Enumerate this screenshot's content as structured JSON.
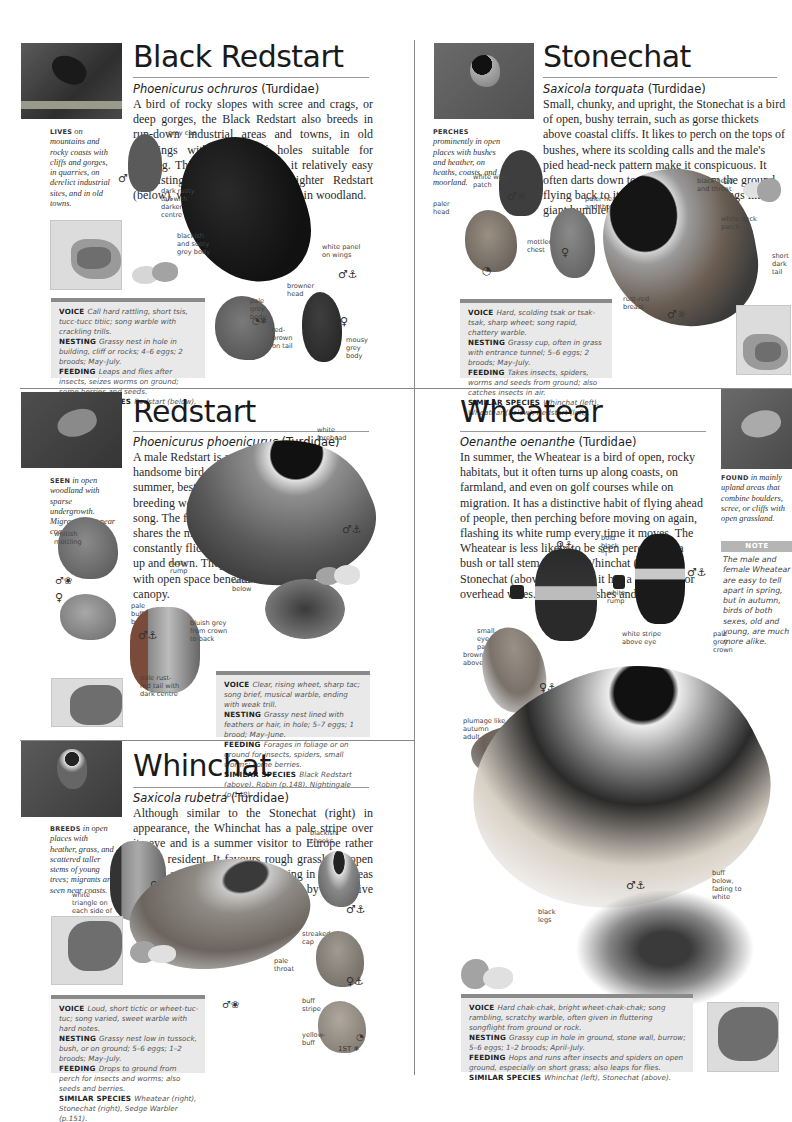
{
  "page": {
    "type": "Bird field guide spread (Chats and Wheatear)"
  },
  "colors": {
    "info_box_bg": "#e9e9e9",
    "info_box_bar": "#8a8a8a",
    "divider": "#888888",
    "note_header": "#b5b5b5"
  },
  "entries": {
    "black_redstart": {
      "title": "Black Redstart",
      "latin": "Phoenicurus ochruros",
      "family": "(Turdidae)",
      "description": "A bird of rocky slopes with scree and crags, or deep gorges, the Black Redstart also breeds in run-down industrial areas and towns, in old buildings with plenty of holes suitable for nesting. This preference makes it relatively easy to distinguish it from the brighter Redstart (below), which nearly always lives in woodland.",
      "habitat_key": "LIVES",
      "habitat_text": "on mountains and rocky coasts with cliffs and gorges, in quarries, on derelict industrial sites, and in old towns.",
      "labels": [
        "grey cap",
        "dark rusty tail with darker centre",
        "blackish and sooty grey body",
        "white panel on wings",
        "browner head",
        "pale grey body",
        "red-brown on tail",
        "mousy grey body"
      ],
      "symbols": [
        "♂",
        "♂⚓",
        "◔❄",
        "♀"
      ],
      "info": {
        "voice_label": "VOICE",
        "voice": "Call hard rattling, short tsis, tucc-tucc titiic; song warble with crackling trills.",
        "nesting_label": "NESTING",
        "nesting": "Grassy nest in hole in building, cliff or rocks; 4–6 eggs; 2 broods; May–July.",
        "feeding_label": "FEEDING",
        "feeding": "Leaps and flies after insects, seizes worms on ground; some berries and seeds.",
        "similar_label": "SIMILAR SPECIES",
        "similar": "Redstart (below), Dunnock (p.148)."
      }
    },
    "stonechat": {
      "title": "Stonechat",
      "latin": "Saxicola torquata",
      "family": "(Turdidae)",
      "description": "Small, chunky, and upright, the Stonechat is a bird of open, bushy terrain, such as gorse thickets above coastal cliffs. It likes to perch on the tops of bushes, where its scolding calls and the male's pied head-neck pattern make it conspicuous. It often darts down to snatch prey from the ground, flying back to its perch on whirring wings like a giant bumblebee.",
      "habitat_key": "PERCHES",
      "habitat_text": "prominently in open places with bushes and heather, on heaths, coasts, and moorland.",
      "labels": [
        "white wing patch",
        "paler head",
        "paler head and throat",
        "mottled chest",
        "black head and throat",
        "white neck patch",
        "short dark tail",
        "rust-red breast"
      ],
      "symbols": [
        "♂☼",
        "♀",
        "◔",
        "♂☼"
      ],
      "info": {
        "voice_label": "VOICE",
        "voice": "Hard, scolding tsak or tsak-tsak, sharp wheet; song rapid, chattery warble.",
        "nesting_label": "NESTING",
        "nesting": "Grassy cup, often in grass with entrance tunnel; 5–6 eggs; 2 broods; May–July.",
        "feeding_label": "FEEDING",
        "feeding": "Takes insects, spiders, worms and seeds from ground; also catches insects in air.",
        "similar_label": "SIMILAR SPECIES",
        "similar": "Whinchat (left), Wheatear (below), Redstart (left)."
      }
    },
    "redstart": {
      "title": "Redstart",
      "latin": "Phoenicurus phoenicurus",
      "family": "(Turdidae)",
      "description": "A male Redstart is an extremely handsome bird in spring and summer, best located in its breeding wood by its short, sweet song. The female, less distinctive, shares the male's habit of constantly flicking its rust-red tail up and down. They like old woods with open space beneath the canopy.",
      "habitat_key": "SEEN",
      "habitat_text": "in open woodland with sparse undergrowth. Migrants seen near coasts or lakes.",
      "labels": [
        "white forehead",
        "whitish mottling",
        "rusty rump",
        "orange-rufous below",
        "pale buff below",
        "bluish grey from crown to back",
        "pale rust-red tail with dark centre"
      ],
      "symbols": [
        "♂⚓",
        "♂❀",
        "♀",
        "♂⚓"
      ],
      "info": {
        "voice_label": "VOICE",
        "voice": "Clear, rising wheet, sharp tac; song brief, musical warble, ending with weak trill.",
        "nesting_label": "NESTING",
        "nesting": "Grassy nest lined with feathers or hair, in hole; 5–7 eggs; 1 brood; May–June.",
        "feeding_label": "FEEDING",
        "feeding": "Forages in foliage or on ground for insects, spiders, small worms; some berries.",
        "similar_label": "SIMILAR SPECIES",
        "similar": "Black Redstart (above), Robin (p.148), Nightingale (p.148)."
      }
    },
    "wheatear": {
      "title": "Wheatear",
      "latin": "Oenanthe oenanthe",
      "family": "(Turdidae)",
      "description": "In summer, the Wheatear is a bird of open, rocky habitats, but it often turns up along coasts, on farmland, and even on golf courses while on migration. It has a distinctive habit of flying ahead of people, then perching before moving on again, flashing its white rump every time it moves. The Wheatear is less likely to be seen perched on a bush or tall stem than the Whinchat (left) or Stonechat (above), although it has a fondness for overhead wires. It avoids bushes and trees.",
      "habitat_key": "FOUND",
      "habitat_text": "in mainly upland areas that combine boulders, scree, or cliffs with open grassland.",
      "note_title": "NOTE",
      "note_text": "The male and female Wheatear are easy to tell apart in spring, but in autumn, birds of both sexes, old and young, are much more alike.",
      "labels": [
        "bold black \"T\"",
        "white rump",
        "small eye-patch",
        "brownish above",
        "white stripe above eye",
        "pale grey crown",
        "black patch through eye",
        "plumage like autumn adult",
        "buff below, fading to white",
        "black legs"
      ],
      "symbols": [
        "♀⚓",
        "♂⚓",
        "♀⚓",
        "◔",
        "♂⚓"
      ],
      "info": {
        "voice_label": "VOICE",
        "voice": "Hard chak-chak, bright wheet-chak-chak; song rambling, scratchy warble, often given in fluttering songflight from ground or rock.",
        "nesting_label": "NESTING",
        "nesting": "Grassy cup in hole in ground, stone wall, burrow; 5–6 eggs; 1–2 broods; April–July.",
        "feeding_label": "FEEDING",
        "feeding": "Hops and runs after insects and spiders on open ground, especially on short grass; also leaps for flies.",
        "similar_label": "SIMILAR SPECIES",
        "similar": "Whinchat (left), Stonechat (above)."
      }
    },
    "whinchat": {
      "title": "Whinchat",
      "latin": "Saxicola rubetra",
      "family": "(Turdidae)",
      "description": "Although similar to the Stonechat (right) in appearance, the Whinchat has a pale stripe over its eye and is a summer visitor to Europe rather than a resident. It favours rough grassland, open heaths, and moors, and is declining in many areas as these habitats are eroded by intensive agriculture and urban development.",
      "habitat_key": "BREEDS",
      "habitat_text": "in open places with heather, grass, and scattered taller stems of young trees; migrants are seen near coasts.",
      "labels": [
        "white triangle on each side of tail",
        "white stripe",
        "dark streaked pale back",
        "blackish cheeks",
        "pale throat",
        "streaked cap",
        "buff stripe",
        "yellow-buff"
      ],
      "symbols": [
        "♀⚓",
        "♂⚓",
        "♂❀",
        "♀⚓",
        "◔",
        "1ST ❄"
      ],
      "info": {
        "voice_label": "VOICE",
        "voice": "Loud, short tictic or wheet-tuc-tuc; song varied, sweet warble with hard notes.",
        "nesting_label": "NESTING",
        "nesting": "Grassy nest low in tussock, bush, or on ground; 5–6 eggs; 1–2 broods; May–July.",
        "feeding_label": "FEEDING",
        "feeding": "Drops to ground from perch for insects and worms; also seeds and berries.",
        "similar_label": "SIMILAR SPECIES",
        "similar": "Wheatear (right), Stonechat (right), Sedge Warbler (p.151)."
      }
    }
  }
}
